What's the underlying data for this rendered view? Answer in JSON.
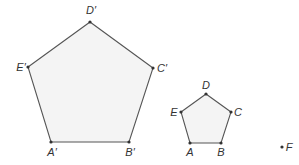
{
  "diagram": {
    "type": "geometry-dilation",
    "colors": {
      "stroke": "#555555",
      "fill": "#f4f4f4",
      "text": "#333333"
    },
    "large_pentagon": {
      "vertices": [
        {
          "label": "A′",
          "x": 51,
          "y": 142,
          "lx": 52,
          "ly": 156
        },
        {
          "label": "B′",
          "x": 129,
          "y": 142,
          "lx": 130,
          "ly": 156
        },
        {
          "label": "C′",
          "x": 153,
          "y": 68,
          "lx": 162,
          "ly": 72
        },
        {
          "label": "D′",
          "x": 90,
          "y": 22,
          "lx": 91,
          "ly": 14
        },
        {
          "label": "E′",
          "x": 28,
          "y": 67,
          "lx": 21,
          "ly": 71
        }
      ]
    },
    "small_pentagon": {
      "vertices": [
        {
          "label": "A",
          "x": 190,
          "y": 143,
          "lx": 190,
          "ly": 156
        },
        {
          "label": "B",
          "x": 221,
          "y": 143,
          "lx": 221,
          "ly": 156
        },
        {
          "label": "C",
          "x": 231,
          "y": 112,
          "lx": 238,
          "ly": 116
        },
        {
          "label": "D",
          "x": 206,
          "y": 94,
          "lx": 206,
          "ly": 89
        },
        {
          "label": "E",
          "x": 181,
          "y": 112,
          "lx": 174,
          "ly": 116
        }
      ]
    },
    "center_point": {
      "label": "F",
      "x": 282,
      "y": 147,
      "lx": 289,
      "ly": 151
    }
  }
}
